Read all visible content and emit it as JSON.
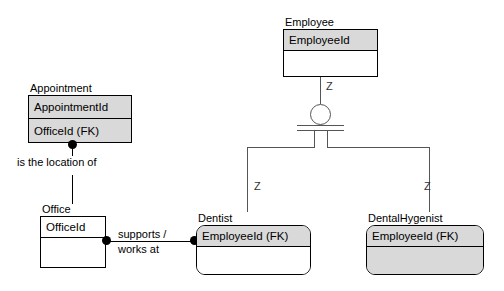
{
  "diagram": {
    "notation": "IDEF1X",
    "accent_shaded": "#d9d9d9",
    "line_color": "#555555"
  },
  "entities": {
    "employee": {
      "name": "Employee",
      "key_attribute": "EmployeeId",
      "non_key_attribute": "",
      "shape": "square",
      "key_shaded": true,
      "body_shaded": false
    },
    "appointment": {
      "name": "Appointment",
      "key_attribute": "AppointmentId",
      "non_key_attribute": "OfficeId (FK)",
      "shape": "square",
      "key_shaded": true,
      "body_shaded": true
    },
    "office": {
      "name": "Office",
      "key_attribute": "OfficeId",
      "non_key_attribute": "",
      "shape": "square",
      "key_shaded": false,
      "body_shaded": false
    },
    "dentist": {
      "name": "Dentist",
      "key_attribute": "EmployeeId (FK)",
      "non_key_attribute": "",
      "shape": "rounded",
      "key_shaded": true,
      "body_shaded": false
    },
    "dental_hygenist": {
      "name": "DentalHygenist",
      "key_attribute": "EmployeeId (FK)",
      "non_key_attribute": "",
      "shape": "rounded",
      "key_shaded": true,
      "body_shaded": true
    }
  },
  "relationships": {
    "appointment_office": {
      "label": "is the location of",
      "from": "Appointment",
      "to": "Office"
    },
    "office_dentist": {
      "label": "supports /\nworks at",
      "label_line1": "supports /",
      "label_line2": "works at",
      "from": "Office",
      "to": "Dentist"
    }
  },
  "cardinality": {
    "employee_to_subtype": "Z",
    "subtype_to_dentist": "Z",
    "subtype_to_dental_hygenist": "Z"
  },
  "symbols": {
    "category_symbol": "complete-category-circle",
    "identifying_dot": "filled-circle"
  }
}
